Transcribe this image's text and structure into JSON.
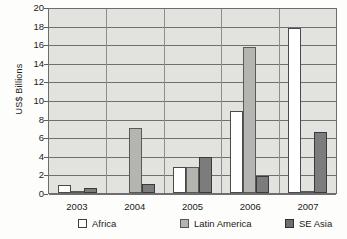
{
  "chart_data": {
    "type": "bar",
    "title": "",
    "xlabel": "",
    "ylabel": "US$ Billions",
    "categories": [
      "2003",
      "2004",
      "2005",
      "2006",
      "2007"
    ],
    "ylim": [
      0,
      20
    ],
    "yticks": [
      20,
      18,
      16,
      14,
      12,
      10,
      8,
      6,
      4,
      2,
      0
    ],
    "grid": true,
    "legend_position": "bottom",
    "series": [
      {
        "name": "Africa",
        "color": "#ffffff",
        "values": [
          0.9,
          0.0,
          2.8,
          8.8,
          17.7
        ]
      },
      {
        "name": "Latin America",
        "color": "#b4b4b0",
        "values": [
          0.2,
          7.0,
          2.8,
          15.7,
          0.1
        ]
      },
      {
        "name": "SE Asia",
        "color": "#7c7c7c",
        "values": [
          0.5,
          1.0,
          3.9,
          1.8,
          6.6
        ]
      }
    ]
  }
}
